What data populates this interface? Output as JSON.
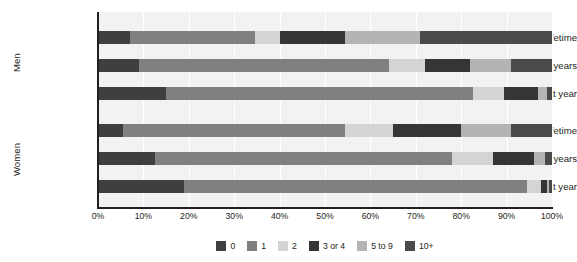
{
  "chart_data": {
    "type": "bar",
    "orientation": "horizontal",
    "stacked": true,
    "normalized_percent": true,
    "title": "",
    "xlabel": "",
    "ylabel": "",
    "xlim": [
      0,
      100
    ],
    "grid": true,
    "grid_axis": "x",
    "legend_position": "bottom",
    "groups": [
      {
        "name": "Men",
        "categories": [
          "Lifetime",
          "Last 5 years",
          "Last year"
        ]
      },
      {
        "name": "Women",
        "categories": [
          "Lifetime",
          "Last 5 years",
          "Last year"
        ]
      }
    ],
    "categories": [
      "Men / Lifetime",
      "Men / Last 5 years",
      "Men / Last year",
      "Women / Lifetime",
      "Women / Last 5 years",
      "Women / Last year"
    ],
    "series": [
      {
        "name": "0",
        "color": "#3f3f3f",
        "values": [
          7.0,
          9.0,
          15.0,
          5.5,
          12.5,
          19.0
        ]
      },
      {
        "name": "1",
        "color": "#808080",
        "values": [
          27.5,
          55.0,
          67.5,
          49.0,
          65.5,
          75.5
        ]
      },
      {
        "name": "2",
        "color": "#d4d4d4",
        "values": [
          5.5,
          8.0,
          7.0,
          10.5,
          9.0,
          3.0
        ]
      },
      {
        "name": "3 or 4",
        "color": "#353535",
        "values": [
          14.5,
          10.0,
          7.5,
          15.0,
          9.0,
          1.3
        ]
      },
      {
        "name": "5 to 9",
        "color": "#b4b4b4",
        "values": [
          16.5,
          9.0,
          2.0,
          11.0,
          2.5,
          0.6
        ]
      },
      {
        "name": "10+",
        "color": "#4a4a4a",
        "values": [
          29.0,
          9.0,
          1.0,
          9.0,
          1.5,
          0.6
        ]
      }
    ],
    "x_ticks": [
      "0%",
      "10%",
      "20%",
      "30%",
      "40%",
      "50%",
      "60%",
      "70%",
      "80%",
      "90%",
      "100%"
    ],
    "x_tick_values": [
      0,
      10,
      20,
      30,
      40,
      50,
      60,
      70,
      80,
      90,
      100
    ],
    "legend": [
      "0",
      "1",
      "2",
      "3 or 4",
      "5 to 9",
      "10+"
    ],
    "plot_background": "#f2f2f2",
    "axis_color": "#231f20"
  }
}
